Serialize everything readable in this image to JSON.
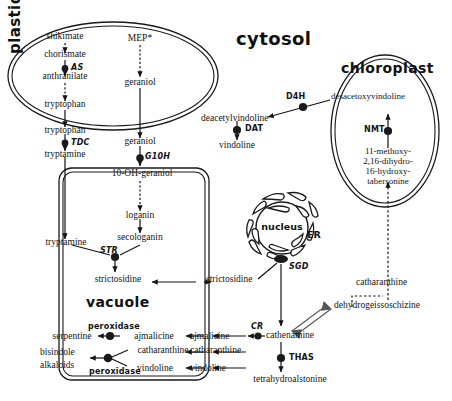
{
  "figure": {
    "type": "diagram",
    "compartments": {
      "cytosol": "cytosol",
      "plastids": "plastids",
      "chloroplast": "chloroplast",
      "vacuole": "vacuole",
      "nucleus": "nucleus",
      "er": "ER"
    }
  },
  "metabolites": {
    "shikimate": "shikimate",
    "chorismate": "chorismate",
    "anthranilate": "anthranilate",
    "tryptophan_plastid": "tryptophan",
    "tryptophan_cytosol": "tryptophan",
    "tryptamine_cytosol": "tryptamine",
    "mep": "MEP*",
    "geraniol_plastid": "geraniol",
    "geraniol_cytosol": "geraniol",
    "oh_geraniol": "10-OH-geraniol",
    "loganin": "loganin",
    "secologanin": "secologanin",
    "tryptamine_vacuole": "tryptamine",
    "strictosidine_vacuole": "strictosidine",
    "strictosidine_cytosol": "strictosidine",
    "serpentine": "serpentine",
    "ajmalicine_vacuole": "ajmalicine",
    "ajmalicine_cytosol": "ajmalicine",
    "bisindole_alkaloids": "bisindole\nalkaloids",
    "bisindole_line1": "bisindole",
    "bisindole_line2": "alkaloids",
    "catharanthine_vacuole": "catharanthine",
    "catharanthine_cytosol": "catharanthine",
    "catharanthine_right": "catharanthine",
    "vindoline_vacuole": "vindoline",
    "vindoline_cytosol": "vindoline",
    "vindoline_upper": "vindoline",
    "deacetylvindoline": "deacetylvindoline",
    "desacetoxyvindoline": "desacetoxyvindoline",
    "tabersonine_l1": "11-methoxy-",
    "tabersonine_l2": "2,16-dihydro-",
    "tabersonine_l3": "16-hydroxy-",
    "tabersonine_l4": "tabersonine",
    "cathenamine": "cathenamine",
    "tetrahydroalstonine": "tetrahydroalstonine",
    "dehydrogeissoschizine": "dehydrogeissoschizine"
  },
  "enzymes": {
    "as": "AS",
    "tdc": "TDC",
    "g10h": "G10H",
    "str": "STR",
    "sgd": "SGD",
    "cr": "CR",
    "thas": "THAS",
    "dat": "DAT",
    "d4h": "D4H",
    "nmt": "NMT",
    "peroxidase_top": "peroxidase",
    "peroxidase_bottom": "peroxidase"
  },
  "colors": {
    "ink": "#141414",
    "membrane": "#1a1a1a",
    "background": "#ffffff"
  }
}
